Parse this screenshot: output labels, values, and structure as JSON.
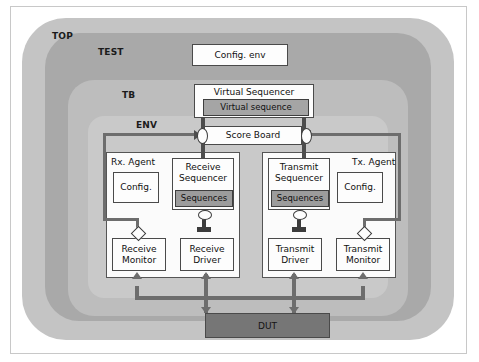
{
  "diagram": {
    "containers": [
      {
        "id": "top",
        "label": "TOP",
        "color": "#c4c4c4"
      },
      {
        "id": "test",
        "label": "TEST",
        "color": "#a9a9a9"
      },
      {
        "id": "tb",
        "label": "TB",
        "color": "#bdbdbd"
      },
      {
        "id": "env",
        "label": "ENV",
        "color": "#c9c9c9"
      }
    ],
    "nodes": {
      "config_env": "Config. env",
      "virtual_sequencer": "Virtual Sequencer",
      "virtual_sequence": "Virtual sequence",
      "score_board": "Score Board",
      "rx_agent": "Rx. Agent",
      "tx_agent": "Tx. Agent",
      "rx_config": "Config.",
      "tx_config": "Config.",
      "receive_sequencer": "Receive\nSequencer",
      "transmit_sequencer": "Transmit\nSequencer",
      "rx_sequences": "Sequences",
      "tx_sequences": "Sequences",
      "receive_monitor": "Receive\nMonitor",
      "receive_driver": "Receive\nDriver",
      "transmit_driver": "Transmit\nDriver",
      "transmit_monitor": "Transmit\nMonitor",
      "dut": "DUT"
    },
    "colors": {
      "top_fill": "#c4c4c4",
      "test_fill": "#a9a9a9",
      "tb_fill": "#bdbdbd",
      "env_fill": "#c9c9c9",
      "box_fill": "#fdfdfd",
      "sequence_fill": "#9c9c9c",
      "virtual_sequence_fill": "#a5a5a5",
      "dut_fill": "#767676",
      "line": "#4d4d4d",
      "bus_line": "#6d6d6d",
      "border": "#4a4a4a"
    }
  }
}
